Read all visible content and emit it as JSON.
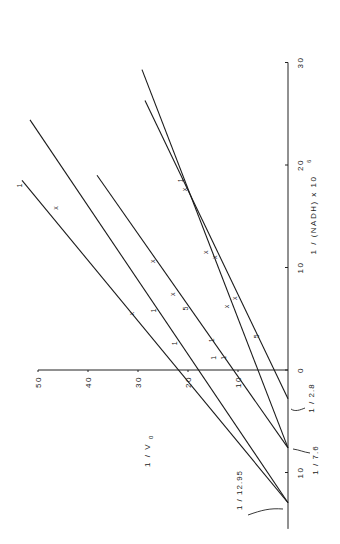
{
  "chart_data": {
    "type": "line",
    "title": "",
    "orientation": "rotated-90-ccw",
    "xlabel": "1 / (NADH) x 10^6",
    "ylabel": "1 / v0",
    "xlim": [
      -15,
      30
    ],
    "ylim": [
      0,
      50
    ],
    "x_ticks": [
      0,
      10,
      20,
      30
    ],
    "x_tick_labels": [
      "0",
      "10",
      "20",
      "30"
    ],
    "x_minor_ticks": [
      -10
    ],
    "x_minor_tick_labels": [
      "10"
    ],
    "y_ticks": [
      10,
      20,
      30,
      40,
      50
    ],
    "y_tick_labels": [
      "10",
      "20",
      "30",
      "40",
      "50"
    ],
    "grid": false,
    "annotations": [
      {
        "text": "1 / 12.95",
        "x": -12.95,
        "y": 0
      },
      {
        "text": "1 / 7.6",
        "x": -7.6,
        "y": 0
      },
      {
        "text": "1 / 2.8",
        "x": -2.8,
        "y": 0
      }
    ],
    "series": [
      {
        "name": "line-1",
        "x": [
          -12.95,
          18.5
        ],
        "y": [
          0,
          53.2
        ],
        "points": [
          {
            "x": 18.0,
            "y": 52.8,
            "marker": "1"
          },
          {
            "x": 5.8,
            "y": 26.0,
            "marker": "1"
          },
          {
            "x": 2.6,
            "y": 21.8,
            "marker": "1"
          }
        ]
      },
      {
        "name": "line-2",
        "x": [
          -12.95,
          24.4
        ],
        "y": [
          0,
          51.6
        ],
        "points": [
          {
            "x": 15.8,
            "y": 45.6,
            "marker": "x"
          },
          {
            "x": 5.5,
            "y": 30.4,
            "marker": "x"
          },
          {
            "x": 1.2,
            "y": 14.0,
            "marker": "1"
          }
        ]
      },
      {
        "name": "line-3",
        "x": [
          -7.6,
          19.0
        ],
        "y": [
          0,
          38.2
        ],
        "points": [
          {
            "x": 10.6,
            "y": 26.2,
            "marker": "x"
          },
          {
            "x": 7.4,
            "y": 22.2,
            "marker": "x"
          },
          {
            "x": 2.9,
            "y": 14.4,
            "marker": "1"
          },
          {
            "x": 1.2,
            "y": 12.0,
            "marker": "1"
          }
        ]
      },
      {
        "name": "line-4",
        "x": [
          -7.6,
          29.3
        ],
        "y": [
          0,
          29.2
        ],
        "points": [
          {
            "x": 18.5,
            "y": 20.6,
            "marker": "1"
          },
          {
            "x": 11.5,
            "y": 15.6,
            "marker": "x"
          },
          {
            "x": 6.2,
            "y": 11.4,
            "marker": "x"
          }
        ]
      },
      {
        "name": "line-5",
        "x": [
          -2.8,
          26.3
        ],
        "y": [
          0,
          28.6
        ],
        "points": [
          {
            "x": 17.6,
            "y": 19.8,
            "marker": "x"
          },
          {
            "x": 11.0,
            "y": 13.8,
            "marker": "x"
          },
          {
            "x": 7.0,
            "y": 9.8,
            "marker": "x"
          },
          {
            "x": 6.0,
            "y": 19.6,
            "marker": "5"
          },
          {
            "x": 3.3,
            "y": 5.4,
            "marker": "5"
          }
        ]
      }
    ]
  },
  "labels": {
    "xlabel": "1 / (NADH)  x  10",
    "xlabel_sup": "6",
    "ylabel": "1 / V",
    "ylabel_sub": "0",
    "ann_1295": "1 / 12.95",
    "ann_76": "1 / 7.6",
    "ann_28": "1 / 2.8"
  }
}
